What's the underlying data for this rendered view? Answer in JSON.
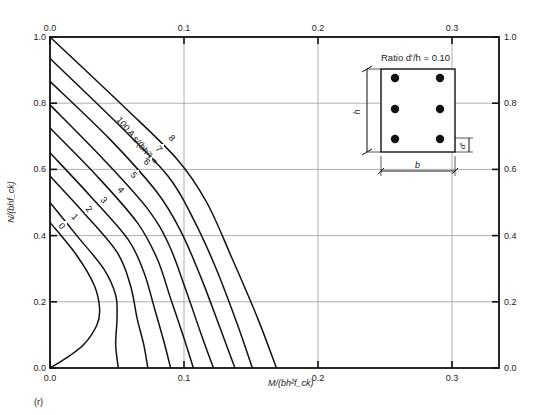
{
  "chart_data": {
    "type": "line",
    "title": "",
    "panel_label": "(r)",
    "xlabel": "M/(bh²f_ck)",
    "ylabel": "N/(bhf_ck)",
    "xlim": [
      0,
      0.33
    ],
    "ylim": [
      0,
      1.0
    ],
    "grid": true,
    "x_ticks": [
      "0.0",
      "0.1",
      "0.2",
      "0.3"
    ],
    "x_tick_values": [
      0,
      0.1,
      0.2,
      0.3
    ],
    "y_ticks": [
      "0.0",
      "0.2",
      "0.4",
      "0.6",
      "0.8",
      "1.0"
    ],
    "y_tick_values": [
      0,
      0.2,
      0.4,
      0.6,
      0.8,
      1.0
    ],
    "curve_family_label": "100 A s/(bh²) =",
    "series": [
      {
        "name": "0",
        "points": [
          [
            0,
            0.44
          ],
          [
            0.02,
            0.34
          ],
          [
            0.033,
            0.25
          ],
          [
            0.037,
            0.18
          ],
          [
            0.035,
            0.13
          ],
          [
            0.025,
            0.07
          ],
          [
            0.012,
            0.03
          ],
          [
            0,
            0
          ]
        ]
      },
      {
        "name": "1",
        "points": [
          [
            0,
            0.5
          ],
          [
            0.02,
            0.4
          ],
          [
            0.04,
            0.3
          ],
          [
            0.049,
            0.22
          ],
          [
            0.05,
            0.15
          ],
          [
            0.049,
            0.07
          ],
          [
            0.051,
            0
          ]
        ]
      },
      {
        "name": "2",
        "points": [
          [
            0,
            0.58
          ],
          [
            0.025,
            0.47
          ],
          [
            0.05,
            0.35
          ],
          [
            0.06,
            0.25
          ],
          [
            0.065,
            0.15
          ],
          [
            0.07,
            0.07
          ],
          [
            0.073,
            0
          ]
        ]
      },
      {
        "name": "3",
        "points": [
          [
            0,
            0.65
          ],
          [
            0.03,
            0.52
          ],
          [
            0.058,
            0.39
          ],
          [
            0.07,
            0.29
          ],
          [
            0.078,
            0.18
          ],
          [
            0.085,
            0.08
          ],
          [
            0.09,
            0
          ]
        ]
      },
      {
        "name": "4",
        "points": [
          [
            0,
            0.725
          ],
          [
            0.035,
            0.58
          ],
          [
            0.065,
            0.44
          ],
          [
            0.08,
            0.33
          ],
          [
            0.09,
            0.21
          ],
          [
            0.1,
            0.09
          ],
          [
            0.107,
            0
          ]
        ]
      },
      {
        "name": "5",
        "points": [
          [
            0,
            0.795
          ],
          [
            0.04,
            0.63
          ],
          [
            0.073,
            0.48
          ],
          [
            0.089,
            0.37
          ],
          [
            0.101,
            0.24
          ],
          [
            0.113,
            0.1
          ],
          [
            0.122,
            0
          ]
        ]
      },
      {
        "name": "6",
        "points": [
          [
            0,
            0.866
          ],
          [
            0.045,
            0.69
          ],
          [
            0.08,
            0.53
          ],
          [
            0.098,
            0.41
          ],
          [
            0.113,
            0.27
          ],
          [
            0.127,
            0.12
          ],
          [
            0.138,
            0
          ]
        ]
      },
      {
        "name": "7",
        "points": [
          [
            0,
            0.935
          ],
          [
            0.05,
            0.74
          ],
          [
            0.088,
            0.58
          ],
          [
            0.107,
            0.45
          ],
          [
            0.124,
            0.3
          ],
          [
            0.14,
            0.13
          ],
          [
            0.151,
            0
          ]
        ]
      },
      {
        "name": "8",
        "points": [
          [
            0,
            1.0
          ],
          [
            0.055,
            0.79
          ],
          [
            0.095,
            0.63
          ],
          [
            0.117,
            0.5
          ],
          [
            0.136,
            0.33
          ],
          [
            0.155,
            0.15
          ],
          [
            0.169,
            0
          ]
        ]
      }
    ],
    "inset": {
      "title": "Ratio d'/h = 0.10",
      "dim_height": "h",
      "dim_width": "b",
      "dim_cover": "d'",
      "bar_rows": 3,
      "bar_cols": 2
    }
  },
  "layout": {
    "plot": {
      "left": 50,
      "top": 37,
      "right": 499,
      "bottom": 368
    },
    "x_per_unit": 1340
  },
  "colors": {
    "line": "#111111",
    "grid": "#9a9a9a",
    "axis": "#111111"
  }
}
